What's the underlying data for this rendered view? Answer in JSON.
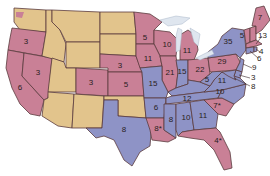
{
  "colors": {
    "tan": "#e2c48c",
    "pink": "#c98096",
    "blue": "#8e93c6",
    "border": "#5b3b3e",
    "background": "#ffffff",
    "lakes": "#dfe6ef"
  },
  "legend_groups": {
    "tan": "states without number",
    "pink": "pink states",
    "blue": "blue states"
  },
  "states": {
    "WA": {
      "value": "",
      "color": "tan"
    },
    "OR": {
      "value": "3",
      "color": "pink"
    },
    "CA": {
      "value": "6",
      "color": "pink"
    },
    "NV": {
      "value": "3",
      "color": "pink"
    },
    "ID": {
      "value": "",
      "color": "tan"
    },
    "MT": {
      "value": "",
      "color": "tan"
    },
    "WY": {
      "value": "",
      "color": "tan"
    },
    "UT": {
      "value": "",
      "color": "tan"
    },
    "AZ": {
      "value": "",
      "color": "tan"
    },
    "CO": {
      "value": "3",
      "color": "pink"
    },
    "NM": {
      "value": "",
      "color": "tan"
    },
    "ND": {
      "value": "",
      "color": "tan"
    },
    "SD": {
      "value": "",
      "color": "tan"
    },
    "NE": {
      "value": "3",
      "color": "pink"
    },
    "KS": {
      "value": "5",
      "color": "pink"
    },
    "OK": {
      "value": "",
      "color": "tan"
    },
    "TX": {
      "value": "8",
      "color": "blue"
    },
    "MN": {
      "value": "5",
      "color": "pink"
    },
    "IA": {
      "value": "11",
      "color": "pink"
    },
    "MO": {
      "value": "15",
      "color": "blue"
    },
    "AR": {
      "value": "6",
      "color": "blue"
    },
    "LA": {
      "value": "8*",
      "color": "pink"
    },
    "WI": {
      "value": "10",
      "color": "pink"
    },
    "IL": {
      "value": "21",
      "color": "pink"
    },
    "MI": {
      "value": "11",
      "color": "pink"
    },
    "IN": {
      "value": "15",
      "color": "blue"
    },
    "OH": {
      "value": "22",
      "color": "pink"
    },
    "KY": {
      "value": "12",
      "color": "blue"
    },
    "TN": {
      "value": "12",
      "color": "blue"
    },
    "MS": {
      "value": "8",
      "color": "blue"
    },
    "AL": {
      "value": "10",
      "color": "blue"
    },
    "GA": {
      "value": "11",
      "color": "blue"
    },
    "FL": {
      "value": "4*",
      "color": "pink"
    },
    "SC": {
      "value": "7*",
      "color": "pink"
    },
    "NC": {
      "value": "10",
      "color": "blue"
    },
    "VA": {
      "value": "11",
      "color": "blue"
    },
    "WV": {
      "value": "5",
      "color": "blue"
    },
    "PA": {
      "value": "29",
      "color": "pink"
    },
    "NY": {
      "value": "35",
      "color": "blue"
    },
    "VT": {
      "value": "5",
      "color": "pink"
    },
    "NH": {
      "value": "",
      "color": "pink"
    },
    "ME": {
      "value": "7",
      "color": "pink"
    },
    "MA": {
      "value": "13",
      "color": "pink"
    },
    "RI": {
      "value": "4",
      "color": "blue"
    },
    "CT": {
      "value": "6",
      "color": "blue"
    },
    "NJ": {
      "value": "9",
      "color": "blue"
    },
    "DE": {
      "value": "3",
      "color": "blue"
    },
    "MD": {
      "value": "8",
      "color": "blue"
    }
  }
}
